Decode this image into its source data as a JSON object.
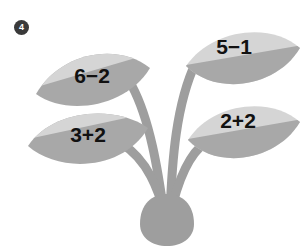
{
  "page": {
    "background_color": "#ffffff",
    "question_badge": {
      "label": "4",
      "shape": "filled-circle",
      "background_color": "#3a3a3a",
      "text_color": "#ffffff"
    }
  },
  "illustration": {
    "name": "plant-with-four-leaves",
    "description": "A stylized sprouting plant: rounded bulb base with four curving stems, each ending in a pointed leaf containing an arithmetic expression.",
    "colors": {
      "leaf_light": "#d5d5d5",
      "leaf_dark": "#a8a8a8",
      "stem": "#9e9e9e",
      "bulb": "#9e9e9e",
      "text": "#111111"
    },
    "bulb": {
      "name": "plant-bulb-base"
    },
    "stems": [
      {
        "name": "stem-upper-left",
        "to_leaf": 0
      },
      {
        "name": "stem-upper-right",
        "to_leaf": 1
      },
      {
        "name": "stem-lower-left",
        "to_leaf": 2
      },
      {
        "name": "stem-lower-right",
        "to_leaf": 3
      }
    ],
    "leaves": [
      {
        "name": "leaf-upper-left",
        "expression": "6−2",
        "side": "left",
        "position": "upper"
      },
      {
        "name": "leaf-upper-right",
        "expression": "5−1",
        "side": "right",
        "position": "upper"
      },
      {
        "name": "leaf-lower-left",
        "expression": "3+2",
        "side": "left",
        "position": "lower"
      },
      {
        "name": "leaf-lower-right",
        "expression": "2+2",
        "side": "right",
        "position": "lower"
      }
    ]
  }
}
